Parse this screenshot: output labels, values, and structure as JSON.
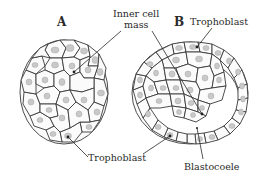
{
  "figure": {
    "panels": [
      {
        "id": "A",
        "label": "A",
        "description": "Morula: solid ball of cells"
      },
      {
        "id": "B",
        "label": "B",
        "description": "Blastocyst: trophoblast ring with inner cell mass and blastocoele cavity"
      }
    ],
    "labels": {
      "panel_a": "A",
      "panel_b": "B",
      "inner_cell_mass_line1": "Inner cell",
      "inner_cell_mass_line2": "mass",
      "trophoblast_top": "Trophoblast",
      "trophoblast_bottom": "Trophoblast",
      "blastocoele": "Blastocoele"
    },
    "colors": {
      "outline": "#3a3a3a",
      "nucleus": "#c9c9c9",
      "text": "#2a2a2a",
      "background": "#ffffff"
    }
  }
}
